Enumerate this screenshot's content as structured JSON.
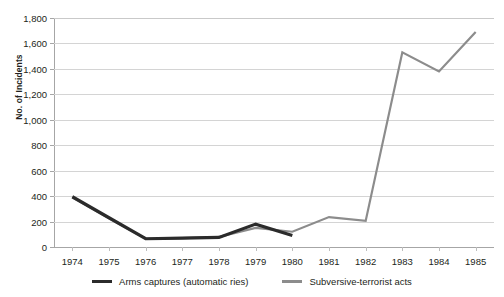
{
  "chart_data": {
    "type": "line",
    "title": "",
    "xlabel": "",
    "ylabel": "No. of Incidents",
    "x": [
      1974,
      1975,
      1976,
      1977,
      1978,
      1979,
      1980,
      1981,
      1982,
      1983,
      1984,
      1985
    ],
    "xtick_labels": [
      "1974",
      "1975",
      "1976",
      "1977",
      "1978",
      "1979",
      "1980",
      "1981",
      "1982",
      "1983",
      "1984",
      "1985"
    ],
    "ytick_labels": [
      "0",
      "200",
      "400",
      "600",
      "800",
      "1,000",
      "1,200",
      "1,400",
      "1,600",
      "1,800"
    ],
    "ytick_values": [
      0,
      200,
      400,
      600,
      800,
      1000,
      1200,
      1400,
      1600,
      1800
    ],
    "ylim": [
      0,
      1800
    ],
    "grid": "horizontal",
    "legend_position": "bottom-center",
    "series": [
      {
        "name": "Arms captures (automatic ries)",
        "color": "#2b2b2b",
        "width": 3.2,
        "values": [
          395,
          230,
          65,
          70,
          75,
          180,
          90,
          null,
          null,
          null,
          null,
          null
        ]
      },
      {
        "name": "Subversive-terrorist acts",
        "color": "#8c8c8c",
        "width": 2.2,
        "values": [
          390,
          225,
          65,
          70,
          80,
          150,
          120,
          235,
          205,
          1530,
          1380,
          1690
        ]
      }
    ]
  },
  "legend": {
    "items": [
      {
        "label": "Arms captures (automatic ries)",
        "color": "#2b2b2b"
      },
      {
        "label": "Subversive-terrorist acts",
        "color": "#8c8c8c"
      }
    ]
  },
  "colors": {
    "series_dark": "#2b2b2b",
    "series_gray": "#8c8c8c",
    "gridline": "#d4d4d4",
    "axis": "#a6a6a6",
    "text": "#231f20",
    "background": "#ffffff"
  }
}
